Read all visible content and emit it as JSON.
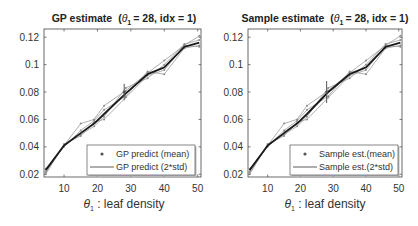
{
  "chart_data": [
    {
      "type": "line",
      "title": "GP estimate",
      "title_param": "= 28, idx = 1)",
      "title_prefix": "(",
      "title_symbol": "θ",
      "title_sub": "1",
      "xlabel_symbol": "θ",
      "xlabel_sub": "1",
      "xlabel": " : leaf density",
      "ylabel": "",
      "xlim": [
        4,
        51
      ],
      "ylim": [
        0.018,
        0.126
      ],
      "xticks": [
        10,
        20,
        30,
        40,
        50
      ],
      "xtick_labels": [
        "10",
        "20",
        "30",
        "40",
        "50"
      ],
      "yticks": [
        0.02,
        0.04,
        0.06,
        0.08,
        0.1,
        0.12
      ],
      "ytick_labels": [
        "0.02",
        "0.04",
        "0.06",
        "0.08",
        "0.1",
        "0.12"
      ],
      "grid": false,
      "legend_position": "bottom-right",
      "legend": [
        "GP predict (mean)",
        "GP predict (2*std)"
      ],
      "x": [
        4.5,
        10,
        15,
        19,
        22,
        28.5,
        35,
        40,
        46,
        50.5
      ],
      "series": [
        {
          "name": "GP predict (mean)",
          "role": "mean",
          "values": [
            0.023,
            0.041,
            0.05,
            0.057,
            0.064,
            0.079,
            0.093,
            0.098,
            0.113,
            0.116
          ]
        },
        {
          "name": "sample 1",
          "role": "sample",
          "values": [
            0.022,
            0.041,
            0.057,
            0.06,
            0.07,
            0.081,
            0.094,
            0.103,
            0.114,
            0.121
          ]
        },
        {
          "name": "sample 2",
          "role": "sample",
          "values": [
            0.024,
            0.04,
            0.052,
            0.059,
            0.067,
            0.077,
            0.095,
            0.093,
            0.112,
            0.114
          ]
        },
        {
          "name": "sample 3",
          "role": "sample",
          "values": [
            0.021,
            0.041,
            0.049,
            0.055,
            0.062,
            0.083,
            0.09,
            0.1,
            0.115,
            0.118
          ]
        },
        {
          "name": "sample 4",
          "role": "sample",
          "values": [
            0.02,
            0.042,
            0.048,
            0.058,
            0.06,
            0.076,
            0.092,
            0.096,
            0.114,
            0.113
          ]
        }
      ],
      "error_bar": {
        "name": "GP predict (2*std)",
        "x": 28,
        "center": 0.08,
        "low": 0.074,
        "high": 0.086
      }
    },
    {
      "type": "line",
      "title": "Sample estimate",
      "title_param": "= 28, idx = 1)",
      "title_prefix": "(",
      "title_symbol": "θ",
      "title_sub": "1",
      "xlabel_symbol": "θ",
      "xlabel_sub": "1",
      "xlabel": " : leaf density",
      "ylabel": "",
      "xlim": [
        4,
        51
      ],
      "ylim": [
        0.018,
        0.126
      ],
      "xticks": [
        10,
        20,
        30,
        40,
        50
      ],
      "xtick_labels": [
        "10",
        "20",
        "30",
        "40",
        "50"
      ],
      "yticks": [
        0.02,
        0.04,
        0.06,
        0.08,
        0.1,
        0.12
      ],
      "ytick_labels": [
        "0.02",
        "0.04",
        "0.06",
        "0.08",
        "0.1",
        "0.12"
      ],
      "grid": false,
      "legend_position": "bottom-right",
      "legend": [
        "Sample est.(mean)",
        "Sample est.(2*std)"
      ],
      "x": [
        4.5,
        10,
        15,
        19,
        22,
        28.5,
        35,
        40,
        46,
        50.5
      ],
      "series": [
        {
          "name": "Sample est.(mean)",
          "role": "mean",
          "values": [
            0.023,
            0.041,
            0.05,
            0.057,
            0.064,
            0.08,
            0.093,
            0.098,
            0.113,
            0.116
          ]
        },
        {
          "name": "sample 1",
          "role": "sample",
          "values": [
            0.022,
            0.041,
            0.057,
            0.06,
            0.07,
            0.081,
            0.094,
            0.103,
            0.114,
            0.121
          ]
        },
        {
          "name": "sample 2",
          "role": "sample",
          "values": [
            0.024,
            0.04,
            0.052,
            0.059,
            0.067,
            0.077,
            0.095,
            0.093,
            0.112,
            0.114
          ]
        },
        {
          "name": "sample 3",
          "role": "sample",
          "values": [
            0.021,
            0.041,
            0.049,
            0.055,
            0.062,
            0.083,
            0.09,
            0.1,
            0.115,
            0.118
          ]
        },
        {
          "name": "sample 4",
          "role": "sample",
          "values": [
            0.02,
            0.042,
            0.048,
            0.058,
            0.06,
            0.076,
            0.092,
            0.096,
            0.114,
            0.113
          ]
        }
      ],
      "error_bar": {
        "name": "Sample est.(2*std)",
        "x": 28,
        "center": 0.08,
        "low": 0.072,
        "high": 0.088
      }
    }
  ]
}
